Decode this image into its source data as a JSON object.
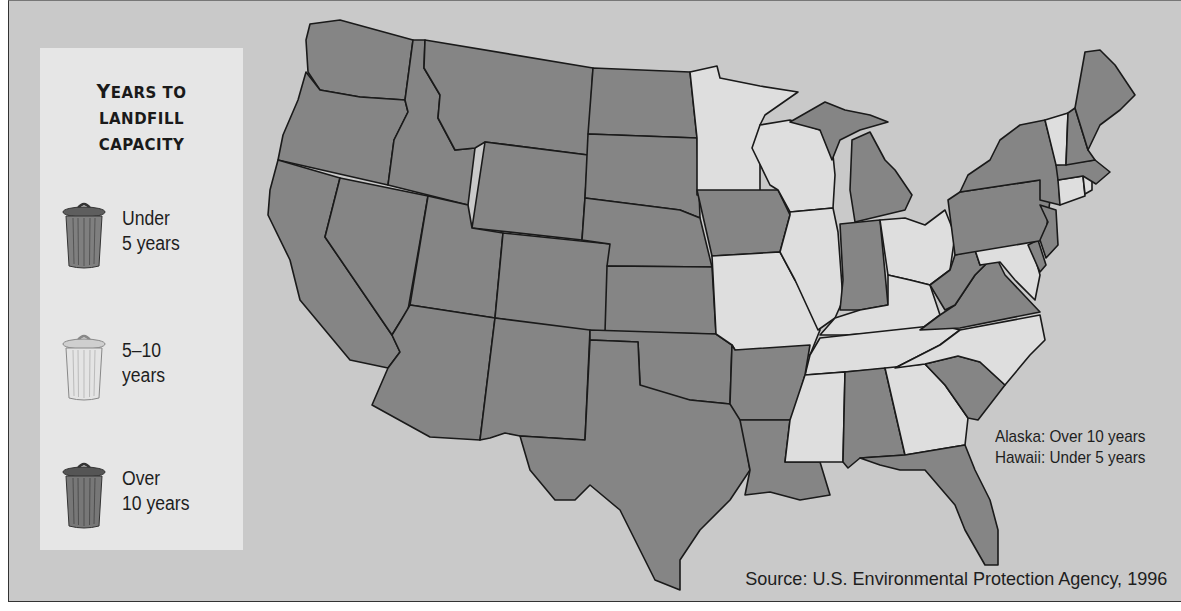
{
  "legend": {
    "title_line1_cap": "Y",
    "title_line1_rest": "EARS TO",
    "title_line2": "LANDFILL",
    "title_line3": "CAPACITY",
    "items": [
      {
        "label": "Under\n5 years",
        "icon": "trash-can-icon",
        "color": "#7f7f7f"
      },
      {
        "label": "5–10\nyears",
        "icon": "trash-can-icon",
        "color": "#e4e4e4"
      },
      {
        "label": "Over\n10 years",
        "icon": "trash-can-icon",
        "color": "#777777"
      }
    ]
  },
  "notes": {
    "alaska": "Alaska: Over 10 years",
    "hawaii": "Hawaii: Under 5 years"
  },
  "source": "Source: U.S. Environmental Protection Agency, 1996",
  "map": {
    "title": "Years to Landfill Capacity",
    "categories": [
      "Under 5 years",
      "5–10 years",
      "Over 10 years"
    ],
    "states_5_10_years": [
      "MN",
      "WI",
      "IL",
      "MO",
      "OH",
      "KY",
      "TN",
      "MS",
      "GA",
      "NC",
      "VT",
      "CT",
      "RI",
      "MD"
    ],
    "states_dark_shade": [
      "WA",
      "OR",
      "CA",
      "ID",
      "NV",
      "MT",
      "WY",
      "UT",
      "AZ",
      "CO",
      "NM",
      "ND",
      "SD",
      "NE",
      "KS",
      "OK",
      "TX",
      "IA",
      "AR",
      "LA",
      "MI",
      "IN",
      "AL",
      "FL",
      "SC",
      "VA",
      "WV",
      "PA",
      "NY",
      "NJ",
      "DE",
      "MA",
      "NH",
      "ME"
    ]
  }
}
